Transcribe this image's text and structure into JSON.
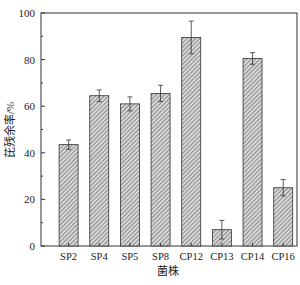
{
  "chart_data": {
    "type": "bar",
    "title": "",
    "xlabel": "菌株",
    "ylabel": "芘残余率/%",
    "ylim": [
      0,
      100
    ],
    "yticks": [
      0,
      20,
      40,
      60,
      80,
      100
    ],
    "grid": false,
    "legend": null,
    "categories": [
      "SP2",
      "SP4",
      "SP5",
      "SP8",
      "CP12",
      "CP13",
      "CP14",
      "CP16"
    ],
    "values": [
      43.5,
      64.5,
      61,
      65.5,
      89.5,
      7,
      80.5,
      25
    ],
    "errors": [
      2,
      2.5,
      3,
      3.5,
      7,
      4,
      2.5,
      3.5
    ],
    "bar_fill": "hatched diagonal gray"
  }
}
